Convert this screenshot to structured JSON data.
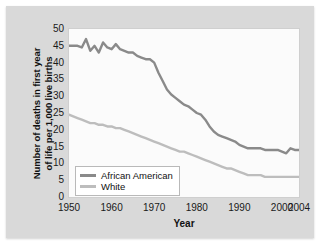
{
  "chart_data": {
    "type": "line",
    "title": "",
    "xlabel": "Year",
    "ylabel": "Number of deaths in first year of life per 1,000 live births",
    "ylabel_line1": "Number of deaths in first year",
    "ylabel_line2": "of life per 1,000 live births",
    "xlim": [
      1950,
      2004
    ],
    "ylim": [
      0,
      50
    ],
    "yticks": [
      50,
      45,
      40,
      35,
      30,
      25,
      20,
      15,
      10,
      5,
      0
    ],
    "xticks": [
      1950,
      1960,
      1970,
      1980,
      1990,
      2000,
      2004
    ],
    "xtick_labels": [
      "1950",
      "1960",
      "1970",
      "1980",
      "1990",
      "2000",
      "2004"
    ],
    "grid": false,
    "legend_position": "lower-left",
    "colors": {
      "african_american": "#8a8a8a",
      "white": "#bdbdbd",
      "plot_background": "#fbfbfb",
      "panel_background": "#d9d9d9",
      "axis_text": "#1a1a1a"
    },
    "x": [
      1950,
      1951,
      1952,
      1953,
      1954,
      1955,
      1956,
      1957,
      1958,
      1959,
      1960,
      1961,
      1962,
      1963,
      1964,
      1965,
      1966,
      1967,
      1968,
      1969,
      1970,
      1971,
      1972,
      1973,
      1974,
      1975,
      1976,
      1977,
      1978,
      1979,
      1980,
      1981,
      1982,
      1983,
      1984,
      1985,
      1986,
      1987,
      1988,
      1989,
      1990,
      1991,
      1992,
      1993,
      1994,
      1995,
      1996,
      1997,
      1998,
      1999,
      2000,
      2001,
      2002,
      2003,
      2004
    ],
    "series": [
      {
        "name": "African American",
        "color": "#8a8a8a",
        "values": [
          45.0,
          45.0,
          45.0,
          44.5,
          47.0,
          43.5,
          45.0,
          43.0,
          46.0,
          44.5,
          44.0,
          45.5,
          44.0,
          43.5,
          43.0,
          43.0,
          42.0,
          41.5,
          41.0,
          41.0,
          40.0,
          37.0,
          34.5,
          32.0,
          30.5,
          29.5,
          28.5,
          27.5,
          27.0,
          26.0,
          25.0,
          24.5,
          23.0,
          21.0,
          19.5,
          18.5,
          18.0,
          17.5,
          17.0,
          16.5,
          15.5,
          15.0,
          14.5,
          14.5,
          14.5,
          14.5,
          14.0,
          14.0,
          14.0,
          14.0,
          13.5,
          13.0,
          14.5,
          14.0,
          14.0
        ]
      },
      {
        "name": "White",
        "color": "#bdbdbd",
        "values": [
          24.5,
          24.0,
          23.5,
          23.0,
          22.5,
          22.0,
          22.0,
          21.5,
          21.5,
          21.0,
          21.0,
          20.5,
          20.5,
          20.0,
          19.5,
          19.0,
          18.5,
          18.0,
          17.5,
          17.0,
          16.5,
          16.0,
          15.5,
          15.0,
          14.5,
          14.0,
          13.5,
          13.5,
          13.0,
          12.5,
          12.0,
          11.5,
          11.0,
          10.5,
          10.0,
          9.5,
          9.0,
          8.5,
          8.5,
          8.0,
          7.5,
          7.0,
          6.5,
          6.5,
          6.5,
          6.5,
          6.0,
          6.0,
          6.0,
          6.0,
          6.0,
          6.0,
          6.0,
          6.0,
          6.0
        ]
      }
    ],
    "legend": [
      {
        "label": "African American",
        "color": "#8a8a8a"
      },
      {
        "label": "White",
        "color": "#bdbdbd"
      }
    ]
  }
}
